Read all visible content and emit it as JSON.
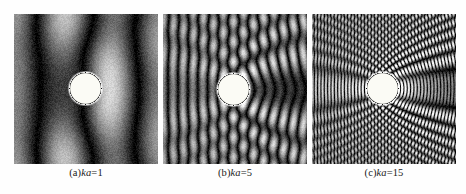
{
  "figure": {
    "background_color": "#fefefe",
    "panel_background_color": "#000000",
    "scatterer_color": "#fbfbf5",
    "caption_color": "#1a1a1a"
  },
  "panels": [
    {
      "id": "a",
      "caption_prefix": "(a)",
      "caption_symbol": "ka",
      "caption_equals": "=",
      "caption_value": "1",
      "caption_full": "(a)ka=1",
      "ka": 1,
      "x": 14,
      "y": 14,
      "width": 144,
      "height": 150,
      "circle_cx": 71,
      "circle_cy": 74,
      "circle_r": 16
    },
    {
      "id": "b",
      "caption_prefix": "(b)",
      "caption_symbol": "ka",
      "caption_equals": "=",
      "caption_value": "5",
      "caption_full": "(b)ka=5",
      "ka": 5,
      "x": 163,
      "y": 14,
      "width": 144,
      "height": 150,
      "circle_cx": 70,
      "circle_cy": 75,
      "circle_r": 16
    },
    {
      "id": "c",
      "caption_prefix": "(c)",
      "caption_symbol": "ka",
      "caption_equals": "=",
      "caption_value": "15",
      "caption_full": "(c)ka=15",
      "ka": 15,
      "x": 312,
      "y": 14,
      "width": 144,
      "height": 150,
      "circle_cx": 70,
      "circle_cy": 74,
      "circle_r": 16
    }
  ],
  "chart_data": {
    "type": "heatmap",
    "xlabel": "",
    "ylabel": "",
    "colormap": "grayscale",
    "value_range": [
      0,
      1
    ],
    "grid": false,
    "legend_position": "none",
    "panel_count": 3,
    "series": [
      {
        "name": "(a)ka=1",
        "ka": 1,
        "wave_direction": "left-to-right",
        "wavelength_px": 100,
        "description": "Long-wavelength regime: one broad diffuse halo arc surrounds the white circular scatterer; a wide dark shadow lobe extends to the left; the field varies slowly with no fine fringes."
      },
      {
        "name": "(b)ka=5",
        "ka": 5,
        "wave_direction": "left-to-right",
        "wavelength_px": 20,
        "description": "Intermediate regime: about five to six concentric bright circular wavefronts radiate outward from the scatterer; a dark shadow region appears behind it on the left; fringes curve around the circle."
      },
      {
        "name": "(c)ka=15",
        "ka": 15,
        "wave_direction": "left-to-right",
        "wavelength_px": 6.7,
        "description": "Short-wavelength regime: many closely spaced concentric fringes; a narrow forward shadow zone of near-vertical stripes extends to the right of the circle; strong backscatter arcs on the left."
      }
    ]
  }
}
